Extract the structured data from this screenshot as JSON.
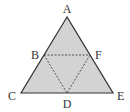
{
  "diagram": {
    "type": "geometry",
    "colors": {
      "fill": "#d3d3d3",
      "stroke": "#333333",
      "dashed": "#444444",
      "label": "#333333",
      "background": "#ffffff"
    },
    "points": {
      "A": {
        "label": "A",
        "x": 67,
        "y": 17
      },
      "B": {
        "label": "B",
        "x": 44,
        "y": 55
      },
      "C": {
        "label": "C",
        "x": 21,
        "y": 93
      },
      "D": {
        "label": "D",
        "x": 67,
        "y": 93
      },
      "E": {
        "label": "E",
        "x": 113,
        "y": 93
      },
      "F": {
        "label": "F",
        "x": 90,
        "y": 55
      }
    },
    "labels": [
      {
        "name": "A",
        "text": "A",
        "x": 67,
        "y": 13,
        "anchor": "middle"
      },
      {
        "name": "B",
        "text": "B",
        "x": 39,
        "y": 59,
        "anchor": "end"
      },
      {
        "name": "C",
        "text": "C",
        "x": 16,
        "y": 100,
        "anchor": "end"
      },
      {
        "name": "D",
        "text": "D",
        "x": 67,
        "y": 108,
        "anchor": "middle"
      },
      {
        "name": "E",
        "text": "E",
        "x": 117,
        "y": 100,
        "anchor": "start"
      },
      {
        "name": "F",
        "text": "F",
        "x": 95,
        "y": 59,
        "anchor": "start"
      }
    ],
    "solid_segments": [
      [
        "A",
        "C"
      ],
      [
        "C",
        "E"
      ],
      [
        "E",
        "A"
      ]
    ],
    "dashed_segments": [
      [
        "B",
        "F"
      ],
      [
        "B",
        "D"
      ],
      [
        "F",
        "D"
      ]
    ]
  }
}
